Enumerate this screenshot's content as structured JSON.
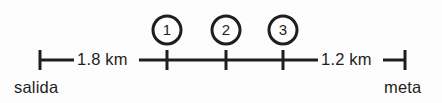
{
  "diagram": {
    "type": "number-line-route",
    "background_color": "#fdfdfd",
    "ink_color": "#1e1e1e",
    "endpoints": {
      "start": {
        "label": "salida",
        "tick_x": 40
      },
      "finish": {
        "label": "meta",
        "tick_x": 405
      }
    },
    "segments": [
      {
        "name": "start-to-marker-1",
        "label": "1.8 km",
        "from": "salida",
        "to": "1"
      },
      {
        "name": "marker-3-to-finish",
        "label": "1.2 km",
        "from": "3",
        "to": "meta"
      }
    ],
    "markers": [
      {
        "id": "marker-1",
        "label": "1",
        "x": 167
      },
      {
        "id": "marker-2",
        "label": "2",
        "x": 226
      },
      {
        "id": "marker-3",
        "label": "3",
        "x": 283
      }
    ],
    "line": {
      "y": 60,
      "thickness": 3,
      "tick_top": 50,
      "tick_bottom": 70
    },
    "circle": {
      "center_y": 30,
      "radius": 14,
      "stroke_width": 3
    }
  }
}
